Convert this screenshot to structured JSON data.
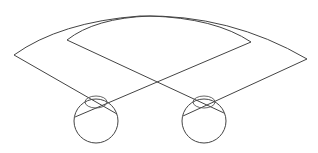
{
  "diagram": {
    "title": "",
    "colors": {
      "stroke": "#444444",
      "background": "#ffffff"
    },
    "eyes": [
      {
        "id": "left-eye",
        "cx": 96,
        "cy": 121,
        "r": 22,
        "lens": {
          "cx": 96,
          "cy": 102,
          "rx": 11,
          "ry": 6
        }
      },
      {
        "id": "right-eye",
        "cx": 204,
        "cy": 121,
        "r": 22,
        "lens": {
          "cx": 204,
          "cy": 102,
          "rx": 11,
          "ry": 6
        }
      }
    ],
    "fields": {
      "outer": {
        "left_corner": [
          14,
          55
        ],
        "apex": [
          145,
          16
        ],
        "right_corner": [
          307,
          59
        ]
      },
      "inner": {
        "left_corner": [
          67,
          40
        ],
        "apex": [
          150,
          16
        ],
        "right_corner": [
          251,
          42
        ]
      }
    }
  }
}
